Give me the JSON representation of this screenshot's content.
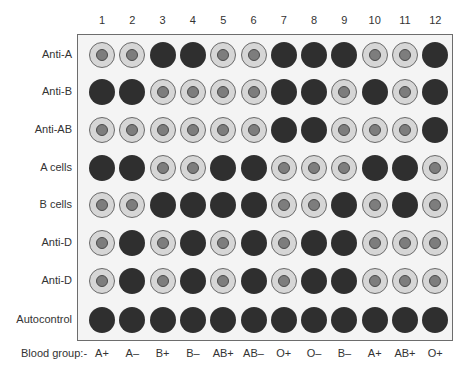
{
  "columns": [
    "1",
    "2",
    "3",
    "4",
    "5",
    "6",
    "7",
    "8",
    "9",
    "10",
    "11",
    "12"
  ],
  "legend": {
    "D": "dark filled well (agglutination)",
    "R": "ring well with central button (no agglutination)"
  },
  "rows": [
    {
      "label": "Anti-A",
      "wells": [
        "R",
        "R",
        "D",
        "D",
        "R",
        "R",
        "D",
        "D",
        "D",
        "R",
        "R",
        "D"
      ]
    },
    {
      "label": "Anti-B",
      "wells": [
        "D",
        "D",
        "R",
        "R",
        "R",
        "R",
        "D",
        "D",
        "R",
        "D",
        "R",
        "D"
      ]
    },
    {
      "label": "Anti-AB",
      "wells": [
        "R",
        "R",
        "R",
        "R",
        "R",
        "R",
        "D",
        "D",
        "R",
        "R",
        "R",
        "D"
      ]
    },
    {
      "label": "A cells",
      "wells": [
        "D",
        "D",
        "R",
        "R",
        "D",
        "D",
        "R",
        "R",
        "R",
        "D",
        "D",
        "R"
      ]
    },
    {
      "label": "B cells",
      "wells": [
        "R",
        "R",
        "D",
        "D",
        "D",
        "D",
        "R",
        "R",
        "D",
        "R",
        "D",
        "R"
      ]
    },
    {
      "label": "Anti-D",
      "wells": [
        "R",
        "D",
        "R",
        "D",
        "R",
        "D",
        "R",
        "D",
        "D",
        "R",
        "R",
        "R"
      ]
    },
    {
      "label": "Anti-D",
      "wells": [
        "R",
        "D",
        "R",
        "D",
        "R",
        "D",
        "R",
        "D",
        "D",
        "R",
        "R",
        "R"
      ]
    },
    {
      "label": "Autocontrol",
      "wells": [
        "D",
        "D",
        "D",
        "D",
        "D",
        "D",
        "D",
        "D",
        "D",
        "D",
        "D",
        "D"
      ]
    }
  ],
  "blood_group_label": "Blood group:-",
  "blood_groups": [
    "A+",
    "A–",
    "B+",
    "B–",
    "AB+",
    "AB–",
    "O+",
    "O–",
    "B–",
    "A+",
    "AB+",
    "O+"
  ],
  "colors": {
    "dark_well": "#2f2f2f",
    "ring_outer": "#d6d6d6",
    "ring_inner": "#7d7d7d",
    "plate_bg": "#f4f4f4",
    "border": "#6d6d6d"
  }
}
